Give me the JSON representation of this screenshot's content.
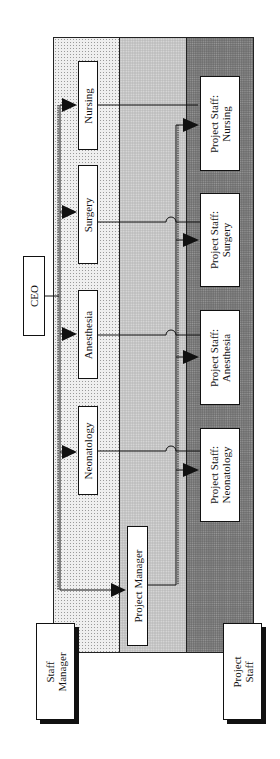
{
  "diagram": {
    "colors": {
      "band_staff": "#efefef",
      "band_manager": "#bdbdbd",
      "band_project": "#6f6f6f",
      "line": "#111111",
      "box_fill": "#ffffff"
    },
    "top_node": {
      "label": "CEO"
    },
    "departments": [
      {
        "label": "Nursing"
      },
      {
        "label": "Surgery"
      },
      {
        "label": "Anesthesia"
      },
      {
        "label": "Neonatology"
      }
    ],
    "project_manager": {
      "label": "Project Manager"
    },
    "project_staff": [
      {
        "line1": "Project Staff:",
        "line2": "Nursing"
      },
      {
        "line1": "Project Staff:",
        "line2": "Surgery"
      },
      {
        "line1": "Project Staff:",
        "line2": "Anesthesia"
      },
      {
        "line1": "Project Staff:",
        "line2": "Neonatology"
      }
    ],
    "legend": [
      {
        "line1": "Staff",
        "line2": "Manager"
      },
      {
        "line1": "Project",
        "line2": "Staff"
      }
    ]
  }
}
